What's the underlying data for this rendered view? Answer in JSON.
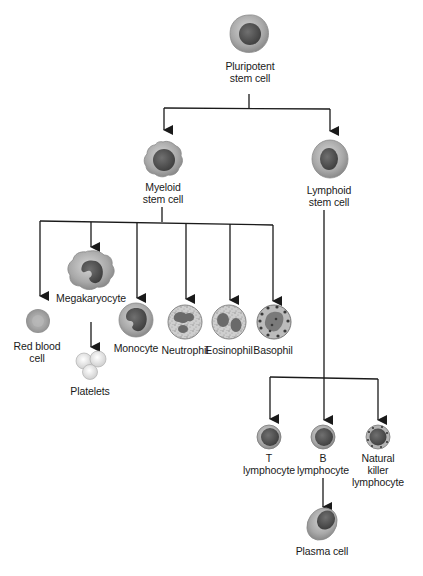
{
  "diagram": {
    "colors": {
      "line": "#1a1a1a",
      "cytoplasm_light": "#bdbdbd",
      "cytoplasm_mid": "#9a9a9a",
      "nucleus": "#5a5a5a",
      "nucleus_dark": "#444444",
      "granule": "#4a4a4a"
    },
    "nodes": {
      "pluripotent": {
        "line1": "Pluripotent",
        "line2": "stem cell"
      },
      "myeloid": {
        "line1": "Myeloid",
        "line2": "stem cell"
      },
      "lymphoid": {
        "line1": "Lymphoid",
        "line2": "stem cell"
      },
      "red_blood_cell": {
        "line1": "Red blood",
        "line2": "cell"
      },
      "megakaryocyte": {
        "line1": "Megakaryocyte"
      },
      "platelets": {
        "line1": "Platelets"
      },
      "monocyte": {
        "line1": "Monocyte"
      },
      "neutrophil": {
        "line1": "Neutrophil"
      },
      "eosinophil": {
        "line1": "Eosinophil"
      },
      "basophil": {
        "line1": "Basophil"
      },
      "t_lymphocyte": {
        "line1": "T",
        "line2": "lymphocyte"
      },
      "b_lymphocyte": {
        "line1": "B",
        "line2": "lymphocyte"
      },
      "nk_lymphocyte": {
        "line1": "Natural",
        "line2": "killer",
        "line3": "lymphocyte"
      },
      "plasma_cell": {
        "line1": "Plasma cell"
      }
    },
    "edges": [
      {
        "from": "Pluripotent stem cell",
        "to": "Myeloid stem cell"
      },
      {
        "from": "Pluripotent stem cell",
        "to": "Lymphoid stem cell"
      },
      {
        "from": "Myeloid stem cell",
        "to": "Red blood cell"
      },
      {
        "from": "Myeloid stem cell",
        "to": "Megakaryocyte"
      },
      {
        "from": "Megakaryocyte",
        "to": "Platelets"
      },
      {
        "from": "Myeloid stem cell",
        "to": "Monocyte"
      },
      {
        "from": "Myeloid stem cell",
        "to": "Neutrophil"
      },
      {
        "from": "Myeloid stem cell",
        "to": "Eosinophil"
      },
      {
        "from": "Myeloid stem cell",
        "to": "Basophil"
      },
      {
        "from": "Lymphoid stem cell",
        "to": "T lymphocyte"
      },
      {
        "from": "Lymphoid stem cell",
        "to": "B lymphocyte"
      },
      {
        "from": "Lymphoid stem cell",
        "to": "Natural killer lymphocyte"
      },
      {
        "from": "B lymphocyte",
        "to": "Plasma cell"
      }
    ]
  }
}
